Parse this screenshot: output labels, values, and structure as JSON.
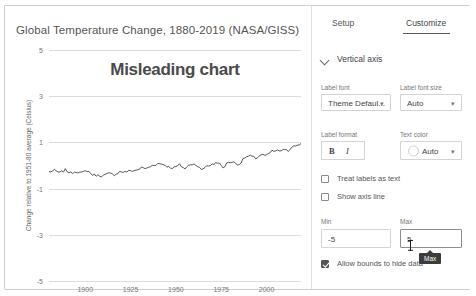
{
  "chart": {
    "title": "Global Temperature Change, 1880-2019 (NASA/GISS)",
    "overlay_label": "Misleading chart",
    "y_axis_title": "Change relative to 1951-80 average (Celsius)"
  },
  "chart_data": {
    "type": "line",
    "title": "Global Temperature Change, 1880-2019 (NASA/GISS)",
    "annotations": [
      "Misleading chart"
    ],
    "xlabel": "",
    "ylabel": "Change relative to 1951-80 average (Celsius)",
    "xlim": [
      1880,
      2019
    ],
    "ylim": [
      -5,
      5
    ],
    "ytick_labels": [
      "5",
      "3",
      "1",
      "-1",
      "-3",
      "-5"
    ],
    "yticks": [
      5,
      3,
      1,
      -1,
      -3,
      -5
    ],
    "xtick_labels": [
      "1900",
      "1925",
      "1950",
      "1975",
      "2000"
    ],
    "xticks": [
      1900,
      1925,
      1950,
      1975,
      2000
    ],
    "grid": true,
    "legend": "none",
    "series": [
      {
        "name": "Global temperature anomaly",
        "color": "#444444",
        "x": [
          1880,
          1883,
          1886,
          1889,
          1892,
          1895,
          1898,
          1901,
          1904,
          1907,
          1910,
          1913,
          1916,
          1919,
          1922,
          1925,
          1928,
          1931,
          1934,
          1937,
          1940,
          1943,
          1946,
          1949,
          1952,
          1955,
          1958,
          1961,
          1964,
          1967,
          1970,
          1973,
          1976,
          1979,
          1982,
          1985,
          1988,
          1991,
          1994,
          1997,
          2000,
          2003,
          2006,
          2009,
          2012,
          2015,
          2018,
          2019
        ],
        "values": [
          -0.27,
          -0.22,
          -0.32,
          -0.19,
          -0.33,
          -0.25,
          -0.33,
          -0.21,
          -0.4,
          -0.43,
          -0.44,
          -0.35,
          -0.4,
          -0.27,
          -0.28,
          -0.23,
          -0.21,
          -0.1,
          -0.13,
          0.0,
          0.08,
          0.06,
          -0.07,
          -0.1,
          0.03,
          -0.14,
          0.06,
          0.06,
          -0.2,
          -0.01,
          0.03,
          0.15,
          -0.1,
          0.16,
          0.13,
          0.05,
          0.35,
          0.41,
          0.31,
          0.47,
          0.42,
          0.62,
          0.63,
          0.66,
          0.64,
          0.9,
          0.85,
          0.98
        ]
      }
    ]
  },
  "panel": {
    "tabs": [
      {
        "label": "Setup",
        "active": false
      },
      {
        "label": "Customize",
        "active": true
      }
    ],
    "section": {
      "chevron_icon": "chevron-down-icon",
      "title": "Vertical axis"
    },
    "label_font": {
      "label": "Label font",
      "value": "Theme Defaul...",
      "caret": "▾"
    },
    "label_font_size": {
      "label": "Label font size",
      "value": "Auto",
      "caret": "▾"
    },
    "label_format": {
      "label": "Label format",
      "bold": "B",
      "italic": "I"
    },
    "text_color": {
      "label": "Text color",
      "value": "Auto",
      "caret": "▾"
    },
    "checkboxes": [
      {
        "label": "Treat labels as text",
        "checked": false
      },
      {
        "label": "Show axis line",
        "checked": false
      }
    ],
    "min": {
      "label": "Min",
      "value": "-5"
    },
    "max": {
      "label": "Max",
      "value": "5"
    },
    "allow_bounds": {
      "label": "Allow bounds to hide data",
      "checked": true
    },
    "tooltip": "Max"
  }
}
